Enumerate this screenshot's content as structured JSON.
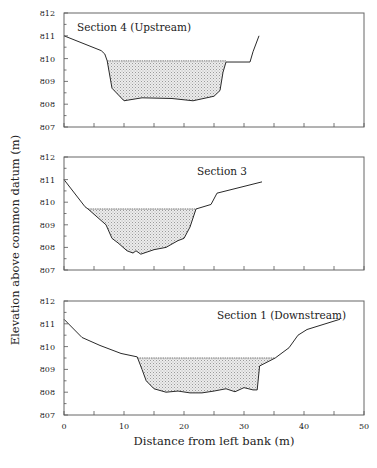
{
  "chart_data": {
    "type": "area",
    "title": "",
    "xlabel": "Distance from left bank (m)",
    "ylabel": "Elevation above common datum (m)",
    "xlim": [
      0,
      50
    ],
    "ylim": [
      807,
      812
    ],
    "xticks": [
      0,
      10,
      20,
      30,
      40,
      50
    ],
    "xticks_minor": [
      5,
      15,
      25,
      35,
      45
    ],
    "yticks": [
      807,
      808,
      809,
      810,
      811,
      812
    ],
    "grid": false,
    "panels": [
      {
        "label": "Section 4 (Upstream)",
        "label_pos": "top-left",
        "water_surface": 809.9,
        "water_x": [
          7.2,
          27.0
        ],
        "bed_profile": {
          "x": [
            0,
            6.2,
            6.8,
            7.2,
            8.0,
            10.0,
            13.0,
            18.0,
            21.5,
            25.0,
            26.0,
            26.5,
            27.0,
            31.0,
            31.5,
            32.5
          ],
          "y": [
            811.0,
            810.35,
            810.2,
            809.9,
            808.7,
            808.15,
            808.28,
            808.25,
            808.15,
            808.35,
            808.6,
            809.4,
            809.85,
            809.85,
            810.3,
            811.0
          ]
        }
      },
      {
        "label": "Section 3",
        "label_pos": "top-center",
        "water_surface": 809.7,
        "water_x": [
          4.0,
          22.0
        ],
        "bed_profile": {
          "x": [
            0,
            3.5,
            4.0,
            7.0,
            8.0,
            9.0,
            10.5,
            11.5,
            12.0,
            12.8,
            15.0,
            17.0,
            19.0,
            20.0,
            21.0,
            22.0,
            24.5,
            25.5,
            33.0
          ],
          "y": [
            811.0,
            809.8,
            809.7,
            809.0,
            808.4,
            808.2,
            807.85,
            807.75,
            807.85,
            807.7,
            807.9,
            808.0,
            808.3,
            808.4,
            808.9,
            809.7,
            809.9,
            810.4,
            810.9
          ]
        }
      },
      {
        "label": "Section 1 (Downstream)",
        "label_pos": "top-right",
        "water_surface": 809.5,
        "water_x": [
          12.2,
          35.2
        ],
        "bed_profile": {
          "x": [
            0,
            3.0,
            6.0,
            9.5,
            12.2,
            13.0,
            13.7,
            15.0,
            17.0,
            19.0,
            21.0,
            23.0,
            25.0,
            27.0,
            28.5,
            30.0,
            31.5,
            32.2,
            32.6,
            35.2,
            37.5,
            39.0,
            40.5,
            46.0
          ],
          "y": [
            811.2,
            810.4,
            810.05,
            809.7,
            809.55,
            809.0,
            808.5,
            808.15,
            808.0,
            808.05,
            807.97,
            807.97,
            808.05,
            808.15,
            808.02,
            808.2,
            808.1,
            808.1,
            809.15,
            809.5,
            809.95,
            810.5,
            810.75,
            811.2
          ]
        }
      }
    ]
  },
  "labels": {
    "ylabel": "Elevation above common datum (m)",
    "xlabel": "Distance from left bank (m)",
    "panel_titles": [
      "Section 4 (Upstream)",
      "Section 3",
      "Section 1 (Downstream)"
    ],
    "ytick_labels": [
      "812",
      "811",
      "810",
      "809",
      "808",
      "807"
    ],
    "xtick_labels": [
      "0",
      "10",
      "20",
      "30",
      "40",
      "50"
    ]
  }
}
